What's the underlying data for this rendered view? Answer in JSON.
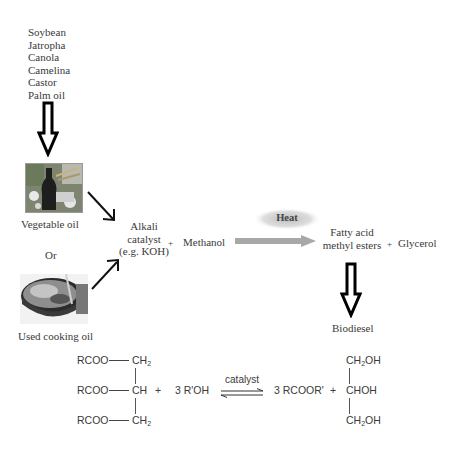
{
  "feedstocks": [
    "Soybean",
    "Jatropha",
    "Canola",
    "Camelina",
    "Castor",
    "Palm oil"
  ],
  "inputs": {
    "vegetable_oil": {
      "label": "Vegetable oil",
      "image": "vegetable-oil-photo"
    },
    "or_label": "Or",
    "used_cooking_oil": {
      "label": "Used cooking oil",
      "image": "frying-pan-photo"
    }
  },
  "reaction_flow": {
    "catalyst_line1": "Alkali",
    "catalyst_line2": "catalyst",
    "catalyst_line3": "(e.g. KOH)",
    "plus1": "+",
    "methanol": "Methanol",
    "heat_label": "Heat",
    "product_line1": "Fatty acid",
    "product_line2": "methyl esters",
    "plus2": "+",
    "glycerol": "Glycerol",
    "final_product": "Biodiesel"
  },
  "equation": {
    "triglyceride": {
      "row1_left": "RCOO",
      "row1_right": "CH",
      "row1_sub": "2",
      "row2_left": "RCOO",
      "row2_right": "CH",
      "row3_left": "RCOO",
      "row3_right": "CH",
      "row3_sub": "2"
    },
    "plus1": "+",
    "alcohol": "3 R'OH",
    "arrow_label": "catalyst",
    "ester": "3 RCOOR'",
    "plus2": "+",
    "glycerol": {
      "row1_pre": "CH",
      "row1_sub": "2",
      "row1_post": "OH",
      "row2": "CHOH",
      "row3_pre": "CH",
      "row3_sub": "2",
      "row3_post": "OH"
    }
  },
  "colors": {
    "text": "#3a3a3a",
    "process_arrow": "#a8a8a8",
    "heat_glow": "#c8c8c8",
    "outline_arrow": "#000000"
  }
}
